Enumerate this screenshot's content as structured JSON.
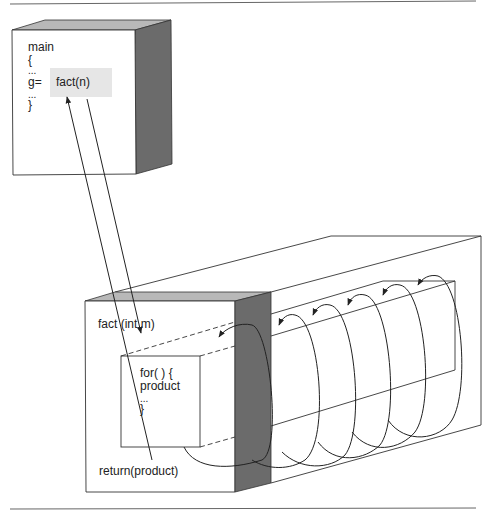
{
  "diagram": {
    "type": "recursion-vs-iteration function call diagram",
    "colors": {
      "line": "#333333",
      "side_face": "#6b6b6b",
      "top_face": "#b8b8b8",
      "highlight": "#e6e6e6",
      "background": "#ffffff"
    },
    "main_box": {
      "lines": [
        "main",
        "{",
        "...",
        "g=",
        "...",
        "}"
      ],
      "call_expression": "fact(n)"
    },
    "fact_box": {
      "signature": "fact (int m)",
      "loop_lines": [
        "for( ) {",
        "product",
        "...",
        "}"
      ],
      "return_statement": "return(product)"
    },
    "loop_iterations": 5,
    "arrows": [
      {
        "from": "main.fact(n)",
        "to": "fact (int m)",
        "meaning": "call"
      },
      {
        "from": "return(product)",
        "to": "main.fact(n)",
        "meaning": "return"
      }
    ]
  }
}
